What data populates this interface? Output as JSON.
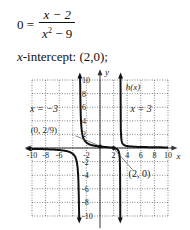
{
  "equation": {
    "lhs": "0 =",
    "numerator": "x − 2",
    "denominator_base": "x",
    "denominator_exp": "2",
    "denominator_rest": " − 9"
  },
  "intercept": {
    "var": "x",
    "text": "-intercept: (2,0);"
  },
  "chart_data": {
    "type": "line",
    "title": "",
    "function_label": "h(x)",
    "function": "h(x) = (x - 2)/(x^2 - 9)",
    "xlabel": "x",
    "ylabel": "y",
    "xlim": [
      -10,
      10
    ],
    "ylim": [
      -10,
      10
    ],
    "grid": true,
    "x_ticks": [
      "-10",
      "-8",
      "-6",
      "-2",
      "2",
      "4",
      "6",
      "8",
      "10"
    ],
    "y_ticks": [
      "10",
      "8",
      "6",
      "4",
      "2",
      "-2",
      "-4",
      "-6",
      "-8",
      "-10"
    ],
    "asymptotes": [
      {
        "type": "vertical",
        "label": "x = −3",
        "x": -3
      },
      {
        "type": "vertical",
        "label": "x = 3",
        "x": 3
      },
      {
        "type": "horizontal",
        "label": "",
        "y": 0
      }
    ],
    "annotations": [
      {
        "label": "(0, 2/9)",
        "x": 0,
        "y": 0.222
      },
      {
        "label": "(2, 0)",
        "x": 2,
        "y": 0
      }
    ],
    "series": [
      {
        "name": "left branch",
        "x": [
          -10,
          -8,
          -6,
          -5,
          -4,
          -3.5,
          -3.2
        ],
        "y": [
          -0.132,
          -0.182,
          -0.296,
          -0.438,
          -0.857,
          -1.692,
          -4.194
        ]
      },
      {
        "name": "middle branch",
        "x": [
          -2.9,
          -2.8,
          -2.5,
          -2,
          -1,
          0,
          1,
          2,
          2.5,
          2.8,
          2.9
        ],
        "y": [
          8.36,
          4.18,
          1.636,
          0.8,
          0.375,
          0.222,
          0.125,
          0,
          -0.182,
          -0.69,
          -1.525
        ]
      },
      {
        "name": "right branch",
        "x": [
          3.1,
          3.2,
          3.5,
          4,
          5,
          6,
          8,
          10
        ],
        "y": [
          1.807,
          0.968,
          0.462,
          0.286,
          0.188,
          0.148,
          0.109,
          0.088
        ]
      }
    ]
  }
}
